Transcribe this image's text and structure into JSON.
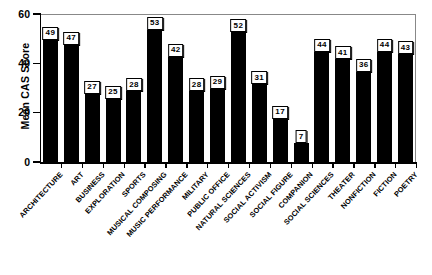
{
  "chart_data": {
    "type": "bar",
    "title": "",
    "subtitle": "",
    "xlabel": "",
    "ylabel": "Mean CAS Score",
    "ylim": [
      0,
      60
    ],
    "yticks": [
      0,
      20,
      40,
      60
    ],
    "ytick_labels": [
      "0",
      "20",
      "40",
      "60"
    ],
    "grid": false,
    "legend": null,
    "bar_color": "#000000",
    "value_labels_shown": true,
    "categories": [
      "ARCHITECTURE",
      "ART",
      "BUSINESS",
      "EXPLORATION",
      "SPORTS",
      "MUSICAL COMPOSING",
      "MUSIC PERFORMANCE",
      "MILITARY",
      "PUBLIC OFFICE",
      "NATURAL SCIENCES",
      "SOCIAL ACTIVISM",
      "SOCIAL FIGURE",
      "COMPANION",
      "SOCIAL SCIENCES",
      "THEATER",
      "NONFICTION",
      "FICTION",
      "POETRY"
    ],
    "values": [
      49,
      47,
      27,
      25,
      28,
      53,
      42,
      28,
      29,
      52,
      31,
      17,
      7,
      44,
      41,
      36,
      44,
      43
    ],
    "value_label_texts": [
      "49",
      "47",
      "27",
      "25",
      "28",
      "53",
      "42",
      "28",
      "29",
      "52",
      "31",
      "17",
      "7",
      "44",
      "41",
      "36",
      "44",
      "43"
    ]
  }
}
